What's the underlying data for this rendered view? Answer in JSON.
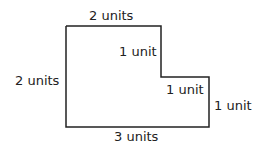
{
  "diagram": {
    "labels": {
      "top": "2 units",
      "left": "2 units",
      "inner_vertical": "1 unit",
      "inner_horizontal": "1 unit",
      "right": "1 unit",
      "bottom": "3 units"
    },
    "stroke_color": "#222222"
  }
}
